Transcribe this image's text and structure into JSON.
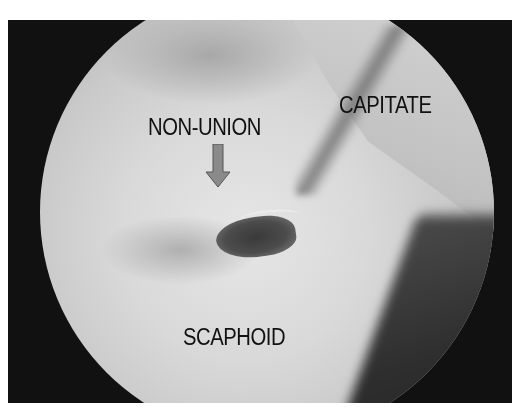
{
  "image": {
    "type": "arthroscopic view",
    "labels": {
      "non_union": "NON-UNION",
      "capitate": "CAPITATE",
      "scaphoid": "SCAPHOID"
    },
    "arrow": {
      "direction": "down",
      "color": "#8a8a8a",
      "stroke": "#555555"
    },
    "colors": {
      "background": "#111111",
      "scope_field": "#d6d6d6",
      "label_text": "#111111"
    }
  }
}
